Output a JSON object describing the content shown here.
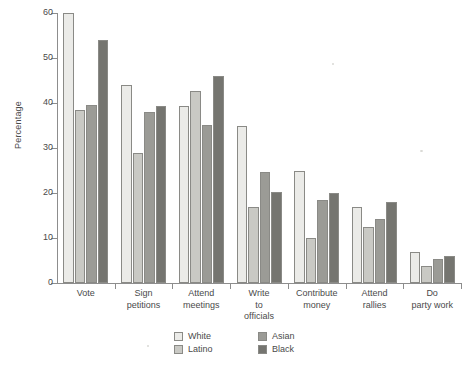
{
  "chart_data": {
    "type": "bar",
    "title": "",
    "xlabel": "",
    "ylabel": "Percentage",
    "ylim": [
      0,
      60
    ],
    "yticks": [
      0,
      10,
      20,
      30,
      40,
      50,
      60
    ],
    "grid": false,
    "legend_position": "bottom-center",
    "categories": [
      "Vote",
      "Sign petitions",
      "Attend meetings",
      "Write to officials",
      "Contribute money",
      "Attend rallies",
      "Do party work"
    ],
    "category_lines": [
      [
        "Vote"
      ],
      [
        "Sign",
        "petitions"
      ],
      [
        "Attend",
        "meetings"
      ],
      [
        "Write",
        "to",
        "officials"
      ],
      [
        "Contribute",
        "money"
      ],
      [
        "Attend",
        "rallies"
      ],
      [
        "Do",
        "party work"
      ]
    ],
    "series": [
      {
        "name": "White",
        "color": "#ebebe8",
        "values": [
          60,
          44,
          39.3,
          35,
          25,
          17,
          7
        ]
      },
      {
        "name": "Latino",
        "color": "#c9c9c4",
        "values": [
          38.5,
          29,
          42.7,
          17,
          10,
          12.4,
          3.8
        ]
      },
      {
        "name": "Asian",
        "color": "#9b9b96",
        "values": [
          39.5,
          38,
          35.2,
          24.7,
          18.4,
          14.3,
          5.4
        ]
      },
      {
        "name": "Black",
        "color": "#757570",
        "values": [
          54,
          39.4,
          46,
          20.2,
          20,
          18,
          6
        ]
      }
    ]
  },
  "legend": {
    "entries": [
      "White",
      "Latino",
      "Asian",
      "Black"
    ]
  },
  "axis": {
    "y_title": "Percentage"
  }
}
